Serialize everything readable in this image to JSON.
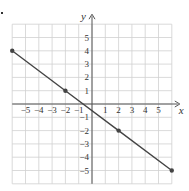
{
  "chart_data": {
    "type": "line",
    "title": "",
    "xlabel": "x",
    "ylabel": "y",
    "xlim": [
      -6,
      6
    ],
    "ylim": [
      -6,
      6
    ],
    "grid": true,
    "x_ticks": [
      "-5",
      "-4",
      "-3",
      "-2",
      "-1",
      "1",
      "2",
      "3",
      "4",
      "5"
    ],
    "y_ticks": [
      "5",
      "4",
      "3",
      "2",
      "1",
      "-1",
      "-2",
      "-3",
      "-4",
      "-5"
    ],
    "series": [
      {
        "name": "line",
        "x": [
          -6,
          -2,
          2,
          6
        ],
        "y": [
          4,
          1,
          -2,
          -5
        ],
        "marked_points": [
          [
            -6,
            4
          ],
          [
            -2,
            1
          ],
          [
            2,
            -2
          ],
          [
            6,
            -5
          ]
        ]
      }
    ],
    "line_color": "#444444",
    "grid_color": "#d0d0d0"
  }
}
